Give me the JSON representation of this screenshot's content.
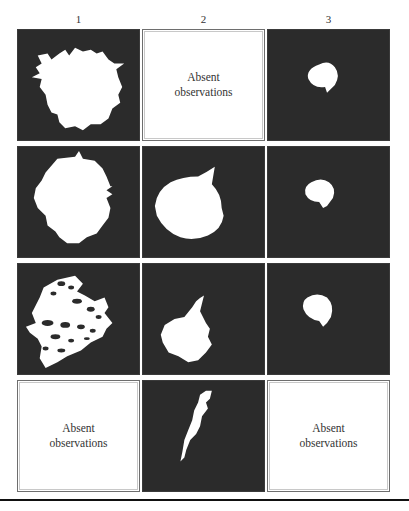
{
  "figure": {
    "column_headers": [
      "1",
      "2",
      "3"
    ],
    "rows": [
      [
        {
          "type": "image",
          "shape": "large-irregular-blob"
        },
        {
          "type": "empty",
          "label": "Absent\nobservations"
        },
        {
          "type": "image",
          "shape": "small-round-blob"
        }
      ],
      [
        {
          "type": "image",
          "shape": "large-irregular-blob"
        },
        {
          "type": "image",
          "shape": "teardrop-blob"
        },
        {
          "type": "image",
          "shape": "small-round-blob"
        }
      ],
      [
        {
          "type": "image",
          "shape": "fragmented-streaked-blob"
        },
        {
          "type": "image",
          "shape": "teardrop-blob"
        },
        {
          "type": "image",
          "shape": "small-round-blob"
        }
      ],
      [
        {
          "type": "empty",
          "label": "Absent\nobservations"
        },
        {
          "type": "image",
          "shape": "elongated-sliver"
        },
        {
          "type": "empty",
          "label": "Absent\nobservations"
        }
      ]
    ],
    "colors": {
      "panel_background": "#2b2b2b",
      "blob_fill": "#ffffff",
      "empty_border": "#6e6e6e",
      "rule": "#111111"
    }
  }
}
